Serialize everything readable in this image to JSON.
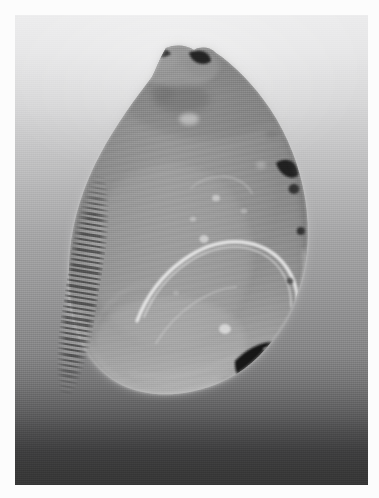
{
  "image": {
    "domain": "Natural-Image",
    "subject": "bivalve-shell-specimen-radiograph",
    "orientation": "portrait",
    "width": 379,
    "height": 498,
    "border": {
      "style": "white photographic mount",
      "color": "#fcfcfc",
      "thickness_px": 15
    },
    "plate": {
      "x": 15,
      "y": 15,
      "width": 353,
      "height": 470,
      "background_description": "smooth vertical gradient, bright near-white at the top fading to dark charcoal gray at the bottom",
      "background_top_color": "#ececed",
      "background_mid_color": "#a4a4a5",
      "background_bottom_color": "#373737"
    },
    "specimen": {
      "description": "single valve of a bivalve shell photographed against a graded backdrop",
      "body_color": "#8e8e8e",
      "body_highlight_color": "#adadad",
      "outline_glow_color": "#d9d9d9",
      "features": [
        {
          "name": "umbo-crown",
          "description": "lobed beak region at the top with two dark notches"
        },
        {
          "name": "dark-notch-left",
          "color": "#2a2a2a"
        },
        {
          "name": "dark-notch-right",
          "color": "#1d1d1d"
        },
        {
          "name": "ribbed-comb-strip",
          "description": "finely banded comb-like strip along the left flank",
          "band_color": "#2a2a2a"
        },
        {
          "name": "bright-pallial-arc",
          "description": "bright curved arc sweeping through the lower right quadrant",
          "color": "#e8e8e8"
        },
        {
          "name": "dark-blotch-lower-right",
          "description": "large black blotch at the lower right margin",
          "color": "#121212"
        },
        {
          "name": "dark-spots-right-margin",
          "description": "small dark spots strung along the right edge",
          "color": "#242424"
        },
        {
          "name": "bright-speckles",
          "description": "scattered small bright specks across the central body",
          "color": "#d4d4d4"
        },
        {
          "name": "growth-striations",
          "description": "faint diagonal growth striations across the shell face"
        }
      ]
    }
  }
}
